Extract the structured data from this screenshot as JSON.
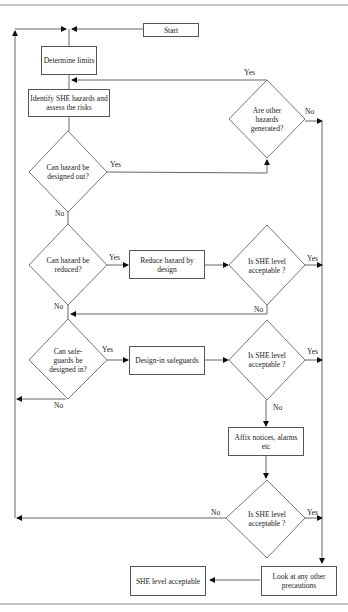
{
  "flowchart": {
    "nodes": {
      "start": "Start",
      "determine_limits": "Determine limits",
      "identify_hazards": "Identify SHE hazards and assess the risks",
      "designed_out": "Can hazard be designed out?",
      "other_hazards": "Are other hazards generated?",
      "reduced": "Can hazard be reduced?",
      "reduce_by_design": "Reduce hazard by design",
      "she_acceptable_1": "Is SHE level acceptable ?",
      "safeguards": "Can safe-guards be designed in?",
      "design_in_safeguards": "Design-in safeguards",
      "she_acceptable_2": "Is SHE level acceptable ?",
      "affix_notices": "Affix notices, alarms etc",
      "she_acceptable_3": "Is SHE level acceptable ?",
      "other_precautions": "Look at any other precautions",
      "she_level_acceptable": "SHE level acceptable"
    },
    "edge_labels": {
      "yes": "Yes",
      "no": "No"
    }
  }
}
